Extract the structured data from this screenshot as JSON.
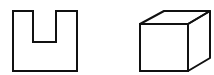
{
  "figure": {
    "width": 214,
    "height": 75,
    "background": "#ffffff",
    "stroke_color": "#111111",
    "stroke_width": 2,
    "shapes": [
      {
        "name": "u-shape-outline",
        "kind": "polygon",
        "points": "13,11 33,11 33,42 56,42 56,11 77,11 77,71 13,71"
      },
      {
        "name": "cube",
        "kind": "cube",
        "front": "140,24 188,24 188,71 140,71",
        "top": "140,24 164,11 210,11 188,24",
        "side": "188,24 210,11 210,58 188,71"
      }
    ]
  }
}
